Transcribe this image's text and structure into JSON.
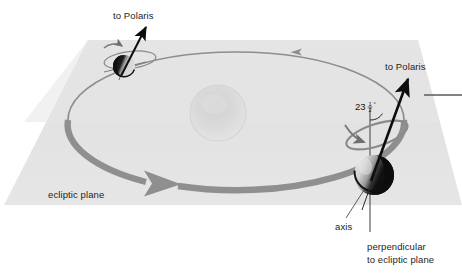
{
  "figure": {
    "type": "astronomy-diagram",
    "background_color": "#ffffff"
  },
  "colors": {
    "plane_fill": "#e2e2e2",
    "plane_fill_light": "#e8e8e8",
    "orbit_stroke": "#8a8a8a",
    "orbit_arrow_thick": "#8f8f8f",
    "axis_line": "#111111",
    "leader_line": "#4a4a4a",
    "text": "#1d1d1d",
    "earth_dark": "#111111",
    "earth_light": "#d8d8d8",
    "sun_fill": "#dcdcdc",
    "precession_stroke": "#7c7c7c"
  },
  "labels": {
    "polaris_top": "to Polaris",
    "polaris_right": "to Polaris",
    "ecliptic_plane": "ecliptic plane",
    "axis": "axis",
    "perpendicular_line1": "perpendicular",
    "perpendicular_line2": "to ecliptic plane",
    "tilt_value": "23",
    "tilt_fraction_numerator": "1",
    "tilt_fraction_denominator": "2",
    "tilt_degree_symbol": "°",
    "tilt_full": "23 1/2 °"
  },
  "elements": {
    "earth_near": {
      "name": "earth-december-position",
      "cx": 374,
      "cy": 175,
      "r": 20
    },
    "earth_far": {
      "name": "earth-june-position",
      "cx": 124,
      "cy": 66,
      "r": 11
    },
    "sun": {
      "name": "sun",
      "cx": 218,
      "cy": 113,
      "r": 28
    },
    "orbit": {
      "name": "earth-orbit-ellipse",
      "cx": 236,
      "cy": 120,
      "rx": 168,
      "ry": 68
    },
    "tilt_degrees": 23.5
  },
  "annotations": {
    "orbit_direction_arrow_near": "counterclockwise-orbit-arrow",
    "orbit_direction_arrow_far": "orbit-direction-arrow-far",
    "precession_arrow_near": "precession-direction-arrow-near",
    "precession_arrow_far": "precession-direction-arrow-far"
  }
}
